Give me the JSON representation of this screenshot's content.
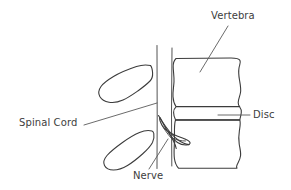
{
  "diagram": {
    "background_color": "#ffffff",
    "line_color": "#3c3c3c",
    "text_color": "#3d3d3d",
    "labels": {
      "vertebra": "Vertebra",
      "disc": "Disc",
      "spinal_cord": "Spinal Cord",
      "nerve": "Nerve"
    },
    "parts": [
      {
        "name": "upper-vertebral-body",
        "label": "Vertebra"
      },
      {
        "name": "intervertebral-disc",
        "label": "Disc"
      },
      {
        "name": "lower-vertebral-body",
        "label": "Vertebra"
      },
      {
        "name": "spinal-canal-lines",
        "label": "Spinal Cord"
      },
      {
        "name": "nerve-root",
        "label": "Nerve"
      },
      {
        "name": "upper-spinous-process",
        "label": ""
      },
      {
        "name": "lower-spinous-process",
        "label": ""
      }
    ]
  }
}
